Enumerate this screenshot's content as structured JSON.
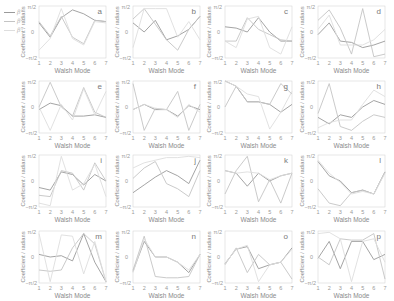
{
  "figure": {
    "legend": [
      {
        "label": "β¹",
        "color": "#9a9a9a"
      },
      {
        "label": "β²",
        "color": "#c4c4c4"
      },
      {
        "label": "β³",
        "color": "#dedede"
      }
    ],
    "ylabel": "Coefficient / radians",
    "xlabel": "Walsh Mode",
    "ytick_labels": [
      "π/2",
      "0",
      "−π/2"
    ],
    "xtick_labels": [
      "1",
      "2",
      "3",
      "4",
      "5",
      "6",
      "7"
    ]
  },
  "chart_data": [
    {
      "panel": "a",
      "type": "line",
      "xlabel": "Walsh Mode",
      "ylabel": "Coefficient / radians",
      "x": [
        1,
        2,
        3,
        4,
        5,
        6,
        7
      ],
      "ylim": [
        "-π/2",
        "π/2"
      ],
      "units": "π/2",
      "series": [
        {
          "name": "β¹",
          "values": [
            0.35,
            -0.2,
            0.55,
            0.85,
            0.7,
            0.45,
            0.4
          ]
        },
        {
          "name": "β²",
          "values": [
            0.4,
            -0.15,
            0.6,
            -0.2,
            -0.45,
            0.45,
            0.4
          ]
        },
        {
          "name": "β³",
          "values": [
            -0.7,
            -0.25,
            0.9,
            -0.25,
            -0.5,
            0.4,
            0.35
          ]
        }
      ]
    },
    {
      "panel": "b",
      "type": "line",
      "xlabel": "Walsh Mode",
      "ylabel": "Coefficient / radians",
      "x": [
        1,
        2,
        3,
        4,
        5,
        6,
        7
      ],
      "ylim": [
        "-π/2",
        "π/2"
      ],
      "units": "π/2",
      "series": [
        {
          "name": "β¹",
          "values": [
            0.35,
            0.0,
            0.45,
            -0.3,
            -0.15,
            0.1,
            0.6
          ]
        },
        {
          "name": "β²",
          "values": [
            0.5,
            0.9,
            0.3,
            -0.3,
            -0.7,
            0.1,
            0.6
          ]
        },
        {
          "name": "β³",
          "values": [
            -0.6,
            0.9,
            0.9,
            0.9,
            -0.2,
            0.4,
            -0.3
          ]
        }
      ]
    },
    {
      "panel": "c",
      "type": "line",
      "xlabel": "Walsh Mode",
      "ylabel": "Coefficient / radians",
      "x": [
        1,
        2,
        3,
        4,
        5,
        6,
        7
      ],
      "ylim": [
        "-π/2",
        "π/2"
      ],
      "units": "π/2",
      "series": [
        {
          "name": "β¹",
          "values": [
            0.2,
            0.15,
            0.0,
            0.55,
            0.0,
            -0.35,
            -0.35
          ]
        },
        {
          "name": "β²",
          "values": [
            -0.35,
            -0.35,
            0.55,
            0.1,
            -0.1,
            -0.3,
            -0.35
          ]
        },
        {
          "name": "β³",
          "values": [
            -0.35,
            -0.6,
            0.5,
            0.6,
            -0.6,
            -0.85,
            0.2
          ]
        }
      ]
    },
    {
      "panel": "d",
      "type": "line",
      "xlabel": "Walsh Mode",
      "ylabel": "Coefficient / radians",
      "x": [
        1,
        2,
        3,
        4,
        5,
        6,
        7
      ],
      "ylim": [
        "-π/2",
        "π/2"
      ],
      "units": "π/2",
      "series": [
        {
          "name": "β¹",
          "values": [
            -0.1,
            0.35,
            -0.35,
            -0.4,
            -0.6,
            -0.5,
            -0.35
          ]
        },
        {
          "name": "β²",
          "values": [
            0.45,
            0.85,
            0.15,
            -0.85,
            0.9,
            -0.95,
            -0.85
          ]
        },
        {
          "name": "β³",
          "values": [
            0.1,
            0.65,
            -0.5,
            -0.5,
            -0.5,
            -0.3,
            0.1
          ]
        }
      ]
    },
    {
      "panel": "e",
      "type": "line",
      "xlabel": "Walsh Mode",
      "ylabel": "Coefficient / radians",
      "x": [
        1,
        2,
        3,
        4,
        5,
        6,
        7
      ],
      "ylim": [
        "-π/2",
        "π/2"
      ],
      "units": "π/2",
      "series": [
        {
          "name": "β¹",
          "values": [
            -0.1,
            0.15,
            0.05,
            -0.35,
            -0.35,
            -0.3,
            -0.4
          ]
        },
        {
          "name": "β²",
          "values": [
            0.0,
            0.95,
            0.0,
            -0.35,
            0.75,
            -0.2,
            -0.4
          ]
        },
        {
          "name": "β³",
          "values": [
            0.0,
            -0.9,
            0.1,
            -0.5,
            0.7,
            -0.3,
            0.6
          ]
        }
      ]
    },
    {
      "panel": "f",
      "type": "line",
      "xlabel": "Walsh Mode",
      "ylabel": "Coefficient / radians",
      "x": [
        1,
        2,
        3,
        4,
        5,
        6,
        7
      ],
      "ylim": [
        "-π/2",
        "π/2"
      ],
      "units": "π/2",
      "series": [
        {
          "name": "β¹",
          "values": [
            -0.1,
            0.1,
            -0.1,
            -0.1,
            -0.35,
            0.05,
            -0.1
          ]
        },
        {
          "name": "β²",
          "values": [
            0.9,
            -0.9,
            -0.05,
            -0.1,
            0.6,
            -0.9,
            0.1
          ]
        },
        {
          "name": "β³",
          "values": [
            -0.1,
            0.1,
            -0.05,
            -0.1,
            -0.4,
            0.1,
            -0.2
          ]
        }
      ]
    },
    {
      "panel": "g",
      "type": "line",
      "xlabel": "Walsh Mode",
      "ylabel": "Coefficient / radians",
      "x": [
        1,
        2,
        3,
        4,
        5,
        6,
        7
      ],
      "ylim": [
        "-π/2",
        "π/2"
      ],
      "units": "π/2",
      "series": [
        {
          "name": "β¹",
          "values": [
            1.0,
            0.8,
            0.2,
            0.2,
            0.1,
            -0.2,
            0.1
          ]
        },
        {
          "name": "β²",
          "values": [
            0.0,
            0.8,
            0.2,
            0.2,
            0.1,
            0.9,
            0.5
          ]
        },
        {
          "name": "β³",
          "values": [
            1.0,
            0.8,
            0.5,
            0.4,
            -0.85,
            -0.2,
            0.6
          ]
        }
      ]
    },
    {
      "panel": "h",
      "type": "line",
      "xlabel": "Walsh Mode",
      "ylabel": "Coefficient / radians",
      "x": [
        1,
        2,
        3,
        4,
        5,
        6,
        7
      ],
      "ylim": [
        "-π/2",
        "π/2"
      ],
      "units": "π/2",
      "series": [
        {
          "name": "β¹",
          "values": [
            -0.4,
            -0.65,
            -0.3,
            -0.4,
            0.0,
            0.25,
            0.1
          ]
        },
        {
          "name": "β²",
          "values": [
            -0.25,
            0.9,
            -0.75,
            -0.9,
            -0.55,
            -0.3,
            -0.4
          ]
        },
        {
          "name": "β³",
          "values": [
            -0.8,
            -0.6,
            -0.5,
            -0.5,
            0.1,
            0.65,
            0.4
          ]
        }
      ]
    },
    {
      "panel": "i",
      "type": "line",
      "xlabel": "Walsh Mode",
      "ylabel": "Coefficient / radians",
      "x": [
        1,
        2,
        3,
        4,
        5,
        6,
        7
      ],
      "ylim": [
        "-π/2",
        "π/2"
      ],
      "units": "π/2",
      "series": [
        {
          "name": "β¹",
          "values": [
            -0.25,
            -0.35,
            0.35,
            0.25,
            -0.15,
            0.25,
            0.0
          ]
        },
        {
          "name": "β²",
          "values": [
            -0.55,
            -0.6,
            0.4,
            0.3,
            -0.35,
            0.7,
            0.0
          ]
        },
        {
          "name": "β³",
          "values": [
            -0.85,
            -0.95,
            0.95,
            -0.35,
            -0.1,
            0.65,
            -0.6
          ]
        }
      ]
    },
    {
      "panel": "j",
      "type": "line",
      "xlabel": "Walsh Mode",
      "ylabel": "Coefficient / radians",
      "x": [
        1,
        2,
        3,
        4,
        5,
        6,
        7
      ],
      "ylim": [
        "-π/2",
        "π/2"
      ],
      "units": "π/2",
      "series": [
        {
          "name": "β¹",
          "values": [
            -0.45,
            -0.15,
            0.15,
            0.4,
            0.2,
            -0.1,
            0.8
          ]
        },
        {
          "name": "β²",
          "values": [
            0.1,
            0.5,
            0.75,
            -0.1,
            -0.3,
            -0.6,
            0.4
          ]
        },
        {
          "name": "β³",
          "values": [
            0.5,
            0.7,
            0.8,
            0.9,
            0.9,
            0.95,
            0.9
          ]
        }
      ]
    },
    {
      "panel": "k",
      "type": "line",
      "xlabel": "Walsh Mode",
      "ylabel": "Coefficient / radians",
      "x": [
        1,
        2,
        3,
        4,
        5,
        6,
        7
      ],
      "ylim": [
        "-π/2",
        "π/2"
      ],
      "units": "π/2",
      "series": [
        {
          "name": "β¹",
          "values": [
            0.4,
            0.3,
            -0.2,
            0.3,
            0.0,
            0.2,
            0.3
          ]
        },
        {
          "name": "β²",
          "values": [
            -0.5,
            0.4,
            0.95,
            -0.8,
            0.05,
            -0.85,
            0.3
          ]
        },
        {
          "name": "β³",
          "values": [
            0.4,
            0.3,
            0.35,
            0.3,
            0.05,
            0.2,
            0.3
          ]
        }
      ]
    },
    {
      "panel": "l",
      "type": "line",
      "xlabel": "Walsh Mode",
      "ylabel": "Coefficient / radians",
      "x": [
        1,
        2,
        3,
        4,
        5,
        6,
        7
      ],
      "ylim": [
        "-π/2",
        "π/2"
      ],
      "units": "π/2",
      "series": [
        {
          "name": "β¹",
          "values": [
            0.75,
            0.2,
            0.0,
            -0.45,
            -0.35,
            -0.5,
            0.35
          ]
        },
        {
          "name": "β²",
          "values": [
            -0.3,
            -0.85,
            -0.95,
            -0.45,
            -0.35,
            -0.5,
            0.35
          ]
        },
        {
          "name": "β³",
          "values": [
            0.8,
            0.3,
            -0.05,
            -0.5,
            -0.4,
            -0.5,
            0.3
          ]
        }
      ]
    },
    {
      "panel": "m",
      "type": "line",
      "xlabel": "Walsh Mode",
      "ylabel": "Coefficient / radians",
      "x": [
        1,
        2,
        3,
        4,
        5,
        6,
        7
      ],
      "ylim": [
        "-π/2",
        "π/2"
      ],
      "units": "π/2",
      "series": [
        {
          "name": "β¹",
          "values": [
            0.1,
            0.0,
            0.05,
            -0.15,
            0.9,
            -0.2,
            -0.95
          ]
        },
        {
          "name": "β²",
          "values": [
            -0.5,
            -0.55,
            -0.5,
            0.35,
            0.9,
            0.5,
            -0.95
          ]
        },
        {
          "name": "β³",
          "values": [
            0.9,
            -0.95,
            0.85,
            0.8,
            -0.65,
            0.6,
            -0.95
          ]
        }
      ]
    },
    {
      "panel": "n",
      "type": "line",
      "xlabel": "Walsh Mode",
      "ylabel": "Coefficient / radians",
      "x": [
        1,
        2,
        3,
        4,
        5,
        6,
        7
      ],
      "ylim": [
        "-π/2",
        "π/2"
      ],
      "units": "π/2",
      "series": [
        {
          "name": "β¹",
          "values": [
            -0.55,
            0.6,
            0.0,
            0.0,
            -0.2,
            -0.6,
            0.1
          ]
        },
        {
          "name": "β²",
          "values": [
            -0.5,
            0.8,
            -0.75,
            -0.8,
            -0.8,
            -0.75,
            0.1
          ]
        },
        {
          "name": "β³",
          "values": [
            -0.6,
            0.7,
            0.0,
            0.0,
            -0.2,
            -0.5,
            0.1
          ]
        }
      ]
    },
    {
      "panel": "o",
      "type": "line",
      "xlabel": "Walsh Mode",
      "ylabel": "Coefficient / radians",
      "x": [
        1,
        2,
        3,
        4,
        5,
        6,
        7
      ],
      "ylim": [
        "-π/2",
        "π/2"
      ],
      "units": "π/2",
      "series": [
        {
          "name": "β¹",
          "values": [
            -0.25,
            0.3,
            0.4,
            -0.45,
            -0.3,
            -0.2,
            0.35
          ]
        },
        {
          "name": "β²",
          "values": [
            -0.3,
            0.35,
            -0.6,
            0.1,
            -0.3,
            -0.2,
            -0.85
          ]
        },
        {
          "name": "β³",
          "values": [
            -0.25,
            0.3,
            0.45,
            -0.95,
            -0.3,
            -0.2,
            0.3
          ]
        }
      ]
    },
    {
      "panel": "p",
      "type": "line",
      "xlabel": "Walsh Mode",
      "ylabel": "Coefficient / radians",
      "x": [
        1,
        2,
        3,
        4,
        5,
        6,
        7
      ],
      "ylim": [
        "-π/2",
        "π/2"
      ],
      "units": "π/2",
      "series": [
        {
          "name": "β¹",
          "values": [
            -0.05,
            0.6,
            -0.45,
            0.6,
            0.6,
            -0.1,
            0.1
          ]
        },
        {
          "name": "β²",
          "values": [
            0.0,
            -0.3,
            0.7,
            0.65,
            0.65,
            0.9,
            -0.85
          ]
        },
        {
          "name": "β³",
          "values": [
            0.9,
            0.95,
            0.7,
            -0.95,
            0.6,
            0.7,
            -0.2
          ]
        }
      ]
    }
  ]
}
